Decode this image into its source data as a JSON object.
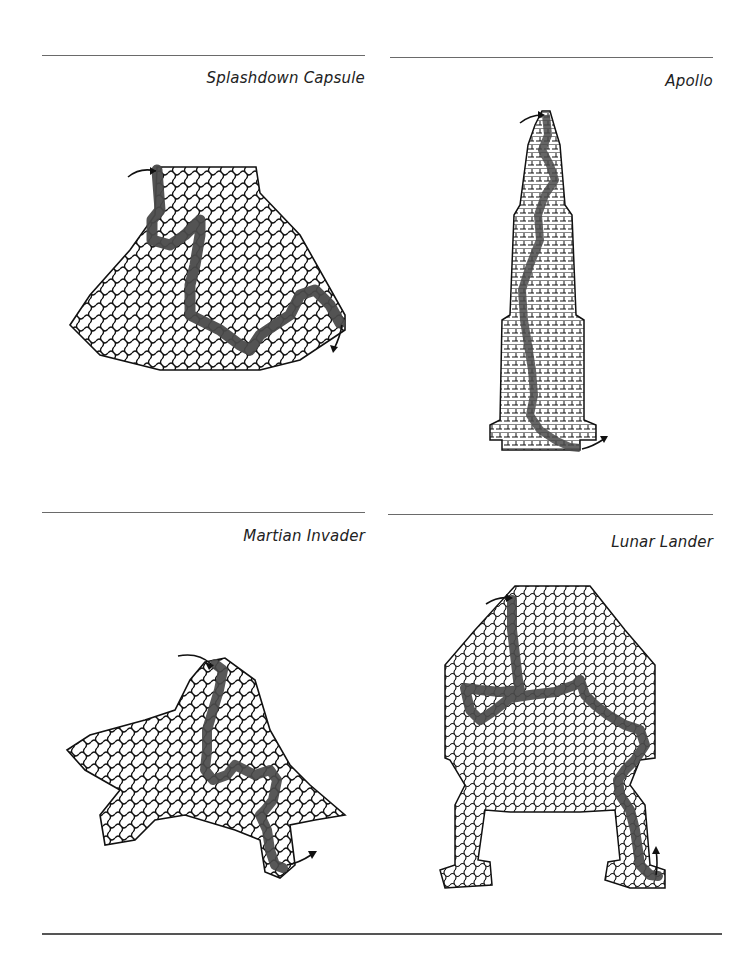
{
  "page": {
    "panels": [
      {
        "id": "splashdown",
        "title": "Splashdown Capsule",
        "style": "hexagonal-curvy",
        "solution_color": "#4a4a4a"
      },
      {
        "id": "apollo",
        "title": "Apollo",
        "style": "orthogonal",
        "solution_color": "#4a4a4a"
      },
      {
        "id": "martian",
        "title": "Martian Invader",
        "style": "hexagonal-curvy",
        "solution_color": "#4a4a4a"
      },
      {
        "id": "lunar",
        "title": "Lunar Lander",
        "style": "hexagonal-curvy",
        "solution_color": "#4a4a4a"
      }
    ]
  }
}
